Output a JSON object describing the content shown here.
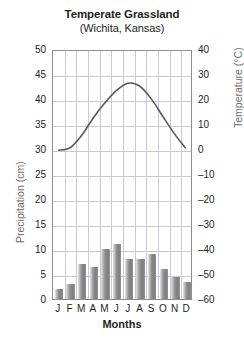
{
  "chart_data": {
    "type": "bar",
    "title": "Temperate Grassland",
    "subtitle": "(Wichita, Kansas)",
    "xlabel": "Months",
    "ylabel": "Precipitation (cm)",
    "y2label": "Temperature (°C)",
    "categories": [
      "J",
      "F",
      "M",
      "A",
      "M",
      "J",
      "J",
      "A",
      "S",
      "O",
      "N",
      "D"
    ],
    "month_names": [
      "January",
      "February",
      "March",
      "April",
      "May",
      "June",
      "July",
      "August",
      "September",
      "October",
      "November",
      "December"
    ],
    "grid": true,
    "legend_position": "none",
    "ylim": [
      0,
      50
    ],
    "yticks": [
      0,
      5,
      10,
      15,
      20,
      25,
      30,
      35,
      40,
      45,
      50
    ],
    "y2lim": [
      -60,
      40
    ],
    "y2ticks": [
      -60,
      -50,
      -40,
      -30,
      -20,
      -10,
      0,
      10,
      20,
      30,
      40
    ],
    "series": [
      {
        "name": "Precipitation",
        "kind": "bar",
        "axis": "left",
        "unit": "cm",
        "color": "#8f8f8f",
        "values": [
          2,
          3,
          7,
          6.5,
          10,
          11,
          8,
          8,
          9,
          6,
          4.5,
          3.5
        ]
      },
      {
        "name": "Temperature",
        "kind": "line",
        "axis": "right",
        "unit": "°C",
        "color": "#595959",
        "values": [
          0,
          1,
          6,
          13,
          19,
          24,
          27,
          26,
          21,
          14,
          7,
          1
        ]
      }
    ]
  }
}
